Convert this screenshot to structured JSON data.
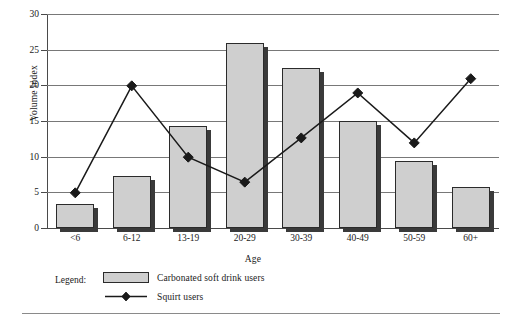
{
  "chart_data": {
    "type": "bar",
    "title": "",
    "xlabel": "Age",
    "ylabel": "Volume Index",
    "categories": [
      "<6",
      "6-12",
      "13-19",
      "20-29",
      "30-39",
      "40-49",
      "50-59",
      "60+"
    ],
    "ylim": [
      0,
      30
    ],
    "yticks": [
      0,
      5,
      10,
      15,
      20,
      25,
      30
    ],
    "grid": true,
    "legend_position": "bottom-left",
    "series": [
      {
        "name": "Carbonated soft drink users",
        "type": "bar",
        "values": [
          3.3,
          7.3,
          14.3,
          26.0,
          22.5,
          15.0,
          9.4,
          5.7
        ]
      },
      {
        "name": "Squirt users",
        "type": "line",
        "marker": "diamond",
        "values": [
          5.0,
          20.0,
          10.0,
          6.5,
          12.7,
          19.0,
          12.0,
          21.0
        ]
      }
    ]
  },
  "legend": {
    "title": "Legend:",
    "bar_label": "Carbonated soft drink users",
    "line_label": "Squirt users"
  },
  "colors": {
    "bar_fill": "#cfcfcf",
    "bar_outline": "#2b2b2b",
    "bar_shadow": "#3a3a3a",
    "line": "#1a1a1a",
    "grid": "#787878",
    "axis": "#4a4a4a",
    "background": "#ffffff"
  }
}
